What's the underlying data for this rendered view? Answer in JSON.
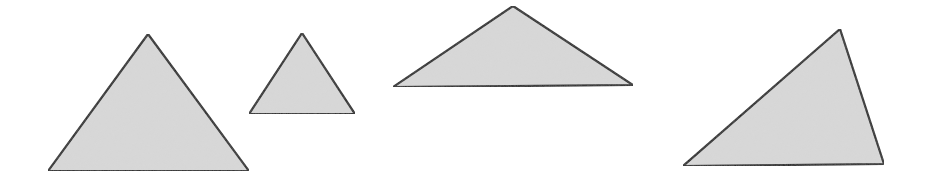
{
  "diagram": {
    "background": "#ffffff",
    "fill": "#d9d9d9",
    "stroke": "#1a1a1a",
    "stroke_width": 2.2,
    "shapes": [
      {
        "name": "triangle-1",
        "type": "triangle",
        "points": [
          [
            148,
            34
          ],
          [
            48,
            171
          ],
          [
            249,
            171
          ]
        ]
      },
      {
        "name": "triangle-2",
        "type": "triangle",
        "points": [
          [
            302,
            33
          ],
          [
            249,
            114
          ],
          [
            355,
            114
          ]
        ]
      },
      {
        "name": "triangle-3",
        "type": "triangle",
        "points": [
          [
            513,
            6
          ],
          [
            393,
            87
          ],
          [
            633,
            85
          ]
        ]
      },
      {
        "name": "triangle-4",
        "type": "triangle",
        "points": [
          [
            840,
            29
          ],
          [
            683,
            166
          ],
          [
            884,
            164
          ]
        ]
      }
    ]
  }
}
